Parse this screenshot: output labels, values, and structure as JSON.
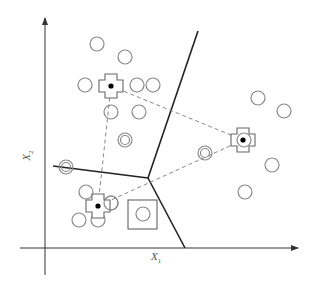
{
  "diagram": {
    "axes": {
      "x_label": "X",
      "x_sub": "1",
      "y_label": "X",
      "y_sub": "2",
      "x_axis": {
        "x1": 20,
        "y1": 248,
        "x2": 298,
        "y2": 248
      },
      "y_axis": {
        "x1": 45,
        "y1": 275,
        "x2": 45,
        "y2": 18
      }
    },
    "colors": {
      "axis": "#333333",
      "boundary": "#222222",
      "point": "#888888",
      "dashed": "#888888",
      "centroid_dot": "#000000"
    },
    "boundaries": [
      {
        "x1": 148,
        "y1": 178,
        "x2": 198,
        "y2": 31
      },
      {
        "x1": 148,
        "y1": 178,
        "x2": 53,
        "y2": 166
      },
      {
        "x1": 148,
        "y1": 178,
        "x2": 185,
        "y2": 248
      }
    ],
    "centroids": [
      {
        "name": "centroid-1",
        "x": 111,
        "y": 86
      },
      {
        "name": "centroid-2",
        "x": 243,
        "y": 140
      },
      {
        "name": "centroid-3",
        "x": 98,
        "y": 206
      }
    ],
    "points": [
      {
        "x": 97,
        "y": 44
      },
      {
        "x": 125,
        "y": 57
      },
      {
        "x": 85,
        "y": 85
      },
      {
        "x": 137,
        "y": 85
      },
      {
        "x": 153,
        "y": 85
      },
      {
        "x": 111,
        "y": 112
      },
      {
        "x": 139,
        "y": 112
      },
      {
        "x": 258,
        "y": 98
      },
      {
        "x": 284,
        "y": 111
      },
      {
        "x": 272,
        "y": 165
      },
      {
        "x": 245,
        "y": 192
      },
      {
        "x": 86,
        "y": 192
      },
      {
        "x": 79,
        "y": 220
      },
      {
        "x": 98,
        "y": 220
      },
      {
        "x": 244,
        "y": 140,
        "half": true
      },
      {
        "x": 111,
        "y": 203,
        "half": true
      }
    ],
    "double_points": [
      {
        "x": 125,
        "y": 140
      },
      {
        "x": 66,
        "y": 167
      },
      {
        "x": 205,
        "y": 153
      }
    ],
    "boxed_point": {
      "x": 143,
      "y": 214,
      "box_x": 128,
      "box_y": 200,
      "box_w": 29,
      "box_h": 29
    }
  }
}
